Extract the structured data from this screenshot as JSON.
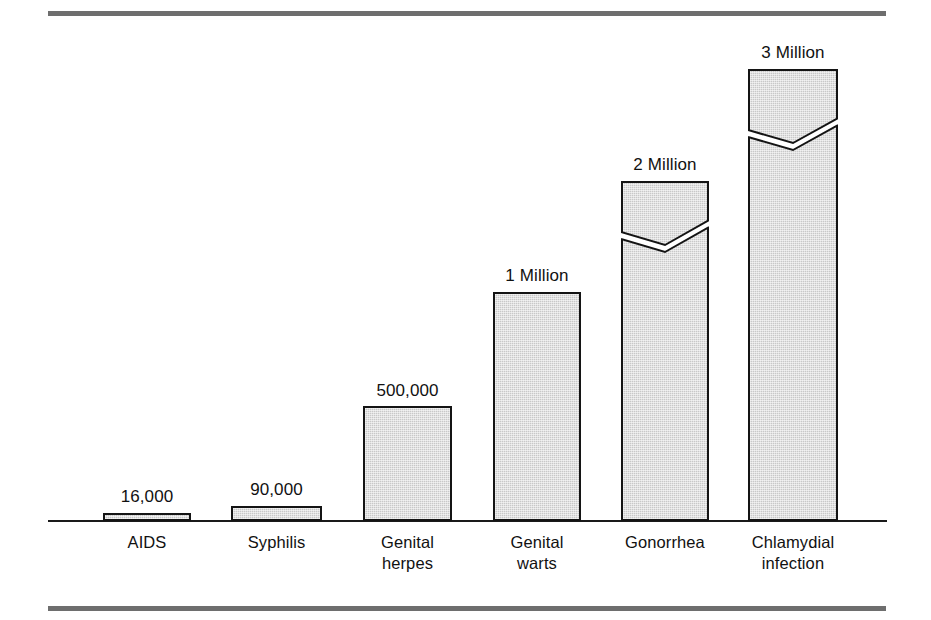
{
  "figure": {
    "width": 931,
    "height": 620,
    "background": "#ffffff",
    "rule_color": "#6e6e6e",
    "axis_color": "#1a1a1a"
  },
  "chart_data": {
    "type": "bar",
    "title": "",
    "subtitle": "",
    "xlabel": "",
    "ylabel": "",
    "grid": false,
    "legend": "none",
    "axis_visible": {
      "x": true,
      "y": false
    },
    "note": "Vertical bars with zigzag break marks on the two tallest bars indicating a broken (non-proportional) scale.",
    "categories": [
      "AIDS",
      "Syphilis",
      "Genital\nherpes",
      "Genital\nwarts",
      "Gonorrhea",
      "Chlamydial\ninfection"
    ],
    "values": [
      16000,
      90000,
      500000,
      1000000,
      2000000,
      3000000
    ],
    "value_labels": [
      "16,000",
      "90,000",
      "500,000",
      "1 Million",
      "2 Million",
      "3 Million"
    ],
    "has_axis_break": [
      false,
      false,
      false,
      false,
      true,
      true
    ],
    "bar_fill": "#c8c8c8",
    "bar_stroke": "#141414"
  },
  "geometry": {
    "baseline_y": 520,
    "axis_left": 48,
    "axis_right": 887,
    "bars": [
      {
        "name": "aids",
        "x": 103,
        "w": 88,
        "top": 513,
        "label_y": 487,
        "cat_y": 532
      },
      {
        "name": "syphilis",
        "x": 231,
        "w": 91,
        "top": 506,
        "label_y": 480,
        "cat_y": 532
      },
      {
        "name": "genital-herpes",
        "x": 363,
        "w": 89,
        "top": 406,
        "label_y": 381,
        "cat_y": 532
      },
      {
        "name": "genital-warts",
        "x": 493,
        "w": 88,
        "top": 292,
        "label_y": 266,
        "cat_y": 532
      },
      {
        "name": "gonorrhea",
        "x": 621,
        "w": 88,
        "top": 181,
        "label_y": 155,
        "cat_y": 532,
        "break_top": 214,
        "break_bottom": 250
      },
      {
        "name": "chlamydial-infection",
        "x": 748,
        "w": 90,
        "top": 69,
        "label_y": 43,
        "cat_y": 532,
        "break_top": 112,
        "break_bottom": 148
      }
    ]
  }
}
